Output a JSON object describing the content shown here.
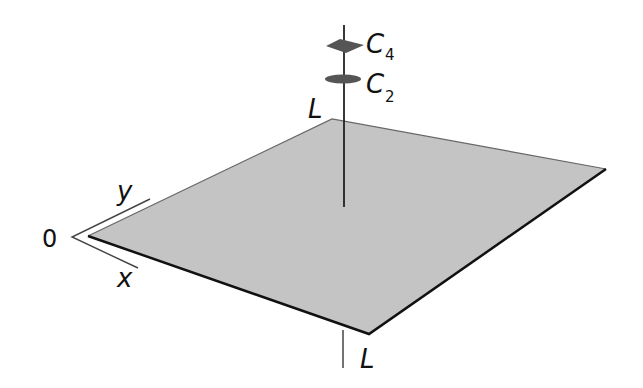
{
  "diagram": {
    "labels": {
      "origin": "0",
      "x_axis": "x",
      "y_axis": "y",
      "top_corner": "L",
      "bottom_corner": "L",
      "c4": "C",
      "c4_sub": "4",
      "c2": "C",
      "c2_sub": "2"
    },
    "colors": {
      "plane_fill": "#c4c4c4",
      "plane_edge": "#111111",
      "axis_line": "#333333",
      "marker_fill": "#555555"
    }
  }
}
